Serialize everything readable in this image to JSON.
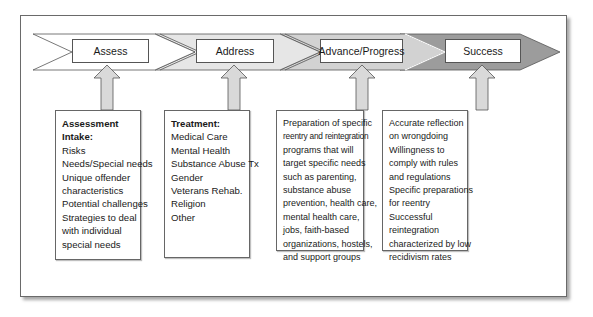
{
  "diagram": {
    "stages": [
      {
        "label": "Assess",
        "fill": "#ffffff"
      },
      {
        "label": "Address",
        "fill": "#e6e6e6"
      },
      {
        "label": "Advance/Progress",
        "fill": "#d2d2d2"
      },
      {
        "label": "Success",
        "fill": "#9c9c9c"
      }
    ],
    "arrow_color": "#d9d9d9",
    "boxes": [
      {
        "title": "Assessment Intake:",
        "lines": [
          "Risks",
          "Needs/Special needs",
          "Unique offender",
          "characteristics",
          "Potential challenges",
          "Strategies to deal",
          "with individual",
          "special needs"
        ]
      },
      {
        "title": "Treatment:",
        "lines": [
          "Medical Care",
          "Mental Health",
          "Substance Abuse Tx",
          "Gender",
          "Veterans Rehab.",
          "Religion",
          "Other"
        ]
      },
      {
        "title": "",
        "lines": [
          "Preparation of specific",
          "reentry and reintegration",
          "programs that will",
          "target specific needs",
          "such as parenting,",
          "substance abuse",
          "prevention, health care,",
          "mental health care,",
          "jobs, faith-based",
          "organizations, hostels,",
          "and support groups"
        ]
      },
      {
        "title": "",
        "lines": [
          "Accurate reflection",
          "on wrongdoing",
          "Willingness to",
          "comply with rules",
          "and regulations",
          "Specific preparations",
          "for reentry",
          "Successful",
          "reintegration",
          "characterized by low",
          "recidivism rates"
        ]
      }
    ]
  }
}
